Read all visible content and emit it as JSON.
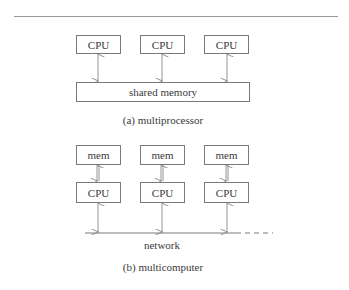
{
  "diagram_a": {
    "cpus": [
      "CPU",
      "CPU",
      "CPU"
    ],
    "memory_label": "shared memory",
    "caption": "(a) multiprocessor"
  },
  "diagram_b": {
    "mems": [
      "mem",
      "mem",
      "mem"
    ],
    "cpus": [
      "CPU",
      "CPU",
      "CPU"
    ],
    "network_label": "network",
    "caption": "(b) multicomputer"
  }
}
